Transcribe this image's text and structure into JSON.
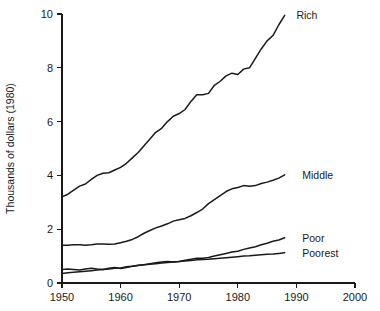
{
  "chart_data": {
    "type": "line",
    "title": "",
    "xlabel": "",
    "ylabel": "Thousands of dollars (1980)",
    "xlim": [
      1950,
      2000
    ],
    "ylim": [
      0,
      10
    ],
    "xticks": [
      1950,
      1960,
      1970,
      1980,
      1990,
      2000
    ],
    "xticklabels": [
      "1950",
      "1960",
      "1970",
      "1980",
      "1990",
      "2000"
    ],
    "yticks": [
      0,
      2,
      4,
      6,
      8,
      10
    ],
    "yticklabels": [
      "0",
      "2",
      "4",
      "6",
      "8",
      "10"
    ],
    "grid": false,
    "legend_position": "right-inline-labels",
    "line_color": "#1a1a1a",
    "series": [
      {
        "name": "Rich",
        "label": "Rich",
        "label_x": 1990,
        "label_y": 9.95,
        "x": [
          1950,
          1951,
          1952,
          1953,
          1954,
          1955,
          1956,
          1957,
          1958,
          1959,
          1960,
          1961,
          1962,
          1963,
          1964,
          1965,
          1966,
          1967,
          1968,
          1969,
          1970,
          1971,
          1972,
          1973,
          1974,
          1975,
          1976,
          1977,
          1978,
          1979,
          1980,
          1981,
          1982,
          1983,
          1984,
          1985,
          1986,
          1987,
          1988
        ],
        "values": [
          3.2,
          3.3,
          3.45,
          3.6,
          3.68,
          3.85,
          4.0,
          4.08,
          4.1,
          4.2,
          4.3,
          4.45,
          4.65,
          4.85,
          5.1,
          5.35,
          5.6,
          5.75,
          6.0,
          6.2,
          6.3,
          6.45,
          6.75,
          7.0,
          7.0,
          7.05,
          7.35,
          7.5,
          7.7,
          7.8,
          7.75,
          7.95,
          8.0,
          8.35,
          8.7,
          9.0,
          9.2,
          9.6,
          9.95
        ]
      },
      {
        "name": "Middle",
        "label": "Middle",
        "label_x": 1991,
        "label_y": 4.02,
        "x": [
          1950,
          1951,
          1952,
          1953,
          1954,
          1955,
          1956,
          1957,
          1958,
          1959,
          1960,
          1961,
          1962,
          1963,
          1964,
          1965,
          1966,
          1967,
          1968,
          1969,
          1970,
          1971,
          1972,
          1973,
          1974,
          1975,
          1976,
          1977,
          1978,
          1979,
          1980,
          1981,
          1982,
          1983,
          1984,
          1985,
          1986,
          1987,
          1988
        ],
        "values": [
          1.4,
          1.4,
          1.42,
          1.42,
          1.4,
          1.42,
          1.45,
          1.45,
          1.44,
          1.45,
          1.5,
          1.55,
          1.62,
          1.72,
          1.85,
          1.95,
          2.05,
          2.12,
          2.2,
          2.3,
          2.35,
          2.4,
          2.5,
          2.62,
          2.75,
          2.95,
          3.1,
          3.25,
          3.4,
          3.5,
          3.55,
          3.62,
          3.6,
          3.62,
          3.7,
          3.75,
          3.82,
          3.9,
          4.02
        ]
      },
      {
        "name": "Poor",
        "label": "Poor",
        "label_x": 1991,
        "label_y": 1.68,
        "x": [
          1950,
          1951,
          1952,
          1953,
          1954,
          1955,
          1956,
          1957,
          1958,
          1959,
          1960,
          1961,
          1962,
          1963,
          1964,
          1965,
          1966,
          1967,
          1968,
          1969,
          1970,
          1971,
          1972,
          1973,
          1974,
          1975,
          1976,
          1977,
          1978,
          1979,
          1980,
          1981,
          1982,
          1983,
          1984,
          1985,
          1986,
          1987,
          1988
        ],
        "values": [
          0.5,
          0.52,
          0.5,
          0.48,
          0.52,
          0.55,
          0.52,
          0.5,
          0.55,
          0.58,
          0.54,
          0.58,
          0.62,
          0.65,
          0.68,
          0.72,
          0.75,
          0.78,
          0.8,
          0.78,
          0.8,
          0.85,
          0.88,
          0.92,
          0.92,
          0.95,
          1.0,
          1.05,
          1.1,
          1.15,
          1.18,
          1.25,
          1.3,
          1.35,
          1.42,
          1.48,
          1.55,
          1.6,
          1.68
        ]
      },
      {
        "name": "Poorest",
        "label": "Poorest",
        "label_x": 1991,
        "label_y": 1.12,
        "x": [
          1950,
          1951,
          1952,
          1953,
          1954,
          1955,
          1956,
          1957,
          1958,
          1959,
          1960,
          1961,
          1962,
          1963,
          1964,
          1965,
          1966,
          1967,
          1968,
          1969,
          1970,
          1971,
          1972,
          1973,
          1974,
          1975,
          1976,
          1977,
          1978,
          1979,
          1980,
          1981,
          1982,
          1983,
          1984,
          1985,
          1986,
          1987,
          1988
        ],
        "values": [
          0.35,
          0.38,
          0.4,
          0.42,
          0.44,
          0.46,
          0.48,
          0.5,
          0.52,
          0.55,
          0.56,
          0.6,
          0.62,
          0.66,
          0.68,
          0.7,
          0.72,
          0.74,
          0.76,
          0.78,
          0.8,
          0.82,
          0.84,
          0.86,
          0.87,
          0.88,
          0.9,
          0.92,
          0.94,
          0.96,
          0.98,
          1.0,
          1.01,
          1.03,
          1.05,
          1.07,
          1.08,
          1.1,
          1.12
        ]
      }
    ]
  }
}
